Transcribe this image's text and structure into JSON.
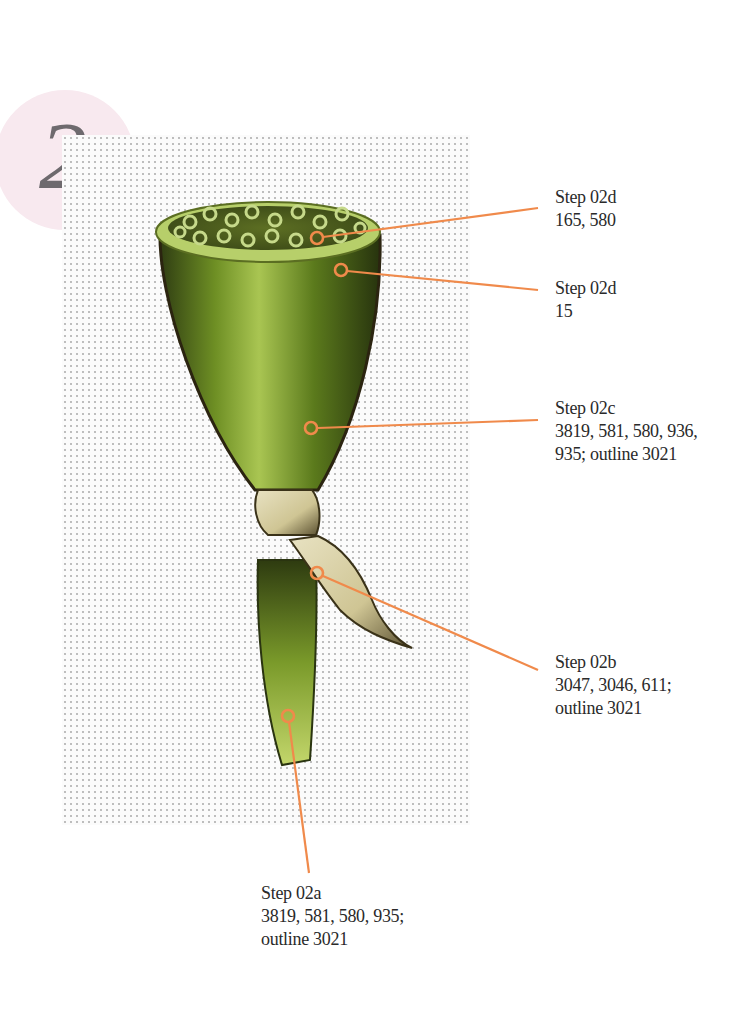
{
  "step_badge": {
    "number": "2"
  },
  "colors": {
    "leader_line": "#f08a4b",
    "badge_bg": "#f8e9ef",
    "badge_text": "#6e6a6e",
    "text": "#2a2a2a"
  },
  "labels": [
    {
      "id": "02d-seeds",
      "title": "Step 02d",
      "lines": [
        "165, 580"
      ]
    },
    {
      "id": "02d-rim",
      "title": "Step 02d",
      "lines": [
        "15"
      ]
    },
    {
      "id": "02c",
      "title": "Step 02c",
      "lines": [
        "3819, 581, 580, 936,",
        "935; outline 3021"
      ]
    },
    {
      "id": "02b",
      "title": "Step 02b",
      "lines": [
        "3047, 3046, 611;",
        "outline 3021"
      ]
    },
    {
      "id": "02a",
      "title": "Step 02a",
      "lines": [
        "3819, 581, 580, 935;",
        "outline 3021"
      ]
    }
  ]
}
